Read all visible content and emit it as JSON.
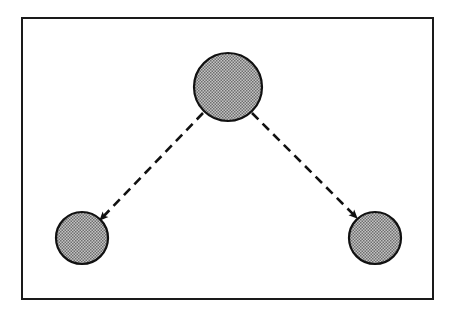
{
  "diagram": {
    "type": "tree",
    "frame": {
      "x": 22,
      "y": 18,
      "width": 411,
      "height": 281,
      "stroke": "#1a1a1a"
    },
    "colors": {
      "background": "#ffffff",
      "stroke": "#111111",
      "node_fill_light": "#d0d0d0",
      "node_fill_dark": "#6a6a6a"
    },
    "nodes": [
      {
        "id": "parent",
        "cx": 228,
        "cy": 87,
        "r": 34,
        "label": ""
      },
      {
        "id": "child-left",
        "cx": 82,
        "cy": 238,
        "r": 26,
        "label": ""
      },
      {
        "id": "child-right",
        "cx": 375,
        "cy": 238,
        "r": 26,
        "label": ""
      }
    ],
    "edges": [
      {
        "from": "parent",
        "to": "child-left",
        "style": "dashed",
        "arrow": "end"
      },
      {
        "from": "parent",
        "to": "child-right",
        "style": "dashed",
        "arrow": "end"
      }
    ]
  }
}
